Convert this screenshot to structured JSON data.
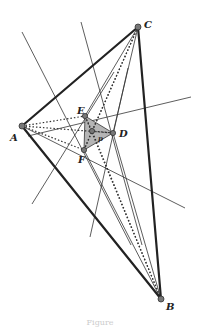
{
  "diagram": {
    "type": "geometry-construction",
    "points": {
      "A": {
        "label": "A",
        "x": 22,
        "y": 126
      },
      "B": {
        "label": "B",
        "x": 161,
        "y": 299
      },
      "C": {
        "label": "C",
        "x": 138,
        "y": 27
      },
      "D": {
        "label": "D",
        "x": 113,
        "y": 133
      },
      "E": {
        "label": "E",
        "x": 85,
        "y": 116
      },
      "F": {
        "label": "F",
        "x": 84,
        "y": 150
      },
      "P": {
        "label": "P",
        "x": 92,
        "y": 131
      }
    },
    "labels": {
      "A": "A",
      "B": "B",
      "C": "C",
      "D": "D",
      "E": "E",
      "F": "F",
      "P": "p"
    },
    "colors": {
      "thick": "#222222",
      "thin": "#333333",
      "fill": "#b5b5b5",
      "point": "#777777"
    }
  },
  "caption": "Figure"
}
